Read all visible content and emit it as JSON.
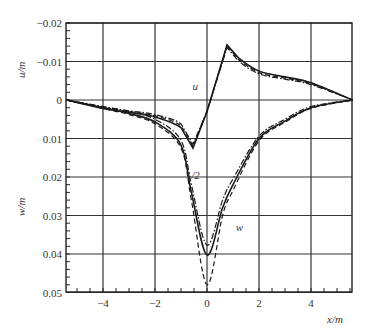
{
  "chart_data": {
    "type": "line",
    "title": "",
    "xlabel": "x/m",
    "ylabel_top": "u/m",
    "ylabel_bottom": "w/m",
    "xlim": [
      -5.4,
      5.6
    ],
    "ylim": [
      -0.02,
      0.05
    ],
    "y_inverted": true,
    "grid": true,
    "legend": null,
    "x_ticks": [
      -4,
      -2,
      0,
      2,
      4
    ],
    "x_tick_labels": [
      "−4",
      "−2",
      "0",
      "2",
      "4"
    ],
    "y_ticks": [
      -0.02,
      -0.01,
      0,
      0.01,
      0.02,
      0.03,
      0.04,
      0.05
    ],
    "y_tick_labels": [
      "−0.02",
      "−0.01",
      "0",
      "0.01",
      "0.02",
      "0.03",
      "0.04",
      "0.05"
    ],
    "annotations": [
      {
        "text": "u",
        "x": -0.45,
        "y": -0.0025
      },
      {
        "text": "1/2",
        "x": -0.55,
        "y": 0.0205
      },
      {
        "text": "w",
        "x": 1.25,
        "y": 0.034
      }
    ],
    "series": [
      {
        "name": "u (solid)",
        "style": "solid",
        "x": [
          -5.4,
          -4,
          -3,
          -2,
          -1,
          -0.54,
          0,
          0.77,
          1.2,
          2,
          3,
          4,
          5.6
        ],
        "y": [
          0,
          0.0022,
          0.0032,
          0.0044,
          0.0072,
          0.0125,
          0.003,
          -0.0143,
          -0.011,
          -0.0075,
          -0.006,
          -0.0045,
          0
        ]
      },
      {
        "name": "u (dash-dot)",
        "style": "dashdot",
        "x": [
          -5.4,
          -4,
          -3,
          -2,
          -1,
          -0.54,
          0,
          0.77,
          1.2,
          2,
          3,
          4,
          5.6
        ],
        "y": [
          0,
          0.0018,
          0.0028,
          0.0038,
          0.0062,
          0.0115,
          0.003,
          -0.0136,
          -0.0102,
          -0.0068,
          -0.0054,
          -0.004,
          0
        ]
      },
      {
        "name": "u (dashed)",
        "style": "dashed",
        "x": [
          -5.4,
          -4,
          -3,
          -2,
          -1,
          -0.54,
          0,
          0.77,
          1.2,
          2,
          3,
          4,
          5.6
        ],
        "y": [
          0,
          0.002,
          0.003,
          0.0041,
          0.0067,
          0.012,
          0.003,
          -0.014,
          -0.0106,
          -0.0071,
          -0.0057,
          -0.0042,
          0
        ]
      },
      {
        "name": "w (solid)",
        "style": "solid",
        "x": [
          -5.4,
          -4,
          -3,
          -2,
          -1,
          -0.6,
          0,
          0.6,
          1,
          2,
          3,
          4,
          5.6
        ],
        "y": [
          0,
          0.002,
          0.0035,
          0.0057,
          0.0117,
          0.024,
          0.0403,
          0.028,
          0.022,
          0.01,
          0.0055,
          0.002,
          0
        ]
      },
      {
        "name": "w (dash-dot)",
        "style": "dashdot",
        "x": [
          -5.4,
          -4,
          -3,
          -2,
          -1,
          -0.6,
          0,
          0.6,
          1,
          2,
          3,
          4,
          5.6
        ],
        "y": [
          0,
          0.0017,
          0.003,
          0.005,
          0.0105,
          0.022,
          0.0377,
          0.026,
          0.0205,
          0.0094,
          0.005,
          0.0017,
          0
        ]
      },
      {
        "name": "w (dashed)",
        "style": "dashed",
        "x": [
          -5.4,
          -4,
          -3,
          -2,
          -1,
          -0.6,
          0,
          0.6,
          1,
          2,
          3,
          4,
          5.6
        ],
        "y": [
          0,
          0.0022,
          0.0038,
          0.0062,
          0.0125,
          0.026,
          0.048,
          0.03,
          0.0235,
          0.0106,
          0.0058,
          0.0022,
          0
        ]
      }
    ]
  }
}
